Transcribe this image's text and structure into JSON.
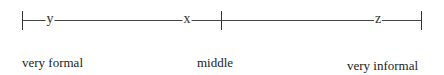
{
  "scale": {
    "marks": [
      {
        "letter": "y",
        "position": "near very formal"
      },
      {
        "letter": "x",
        "position": "near middle, formal side"
      },
      {
        "letter": "z",
        "position": "near very informal"
      }
    ],
    "labels": {
      "left": "very formal",
      "center": "middle",
      "right": "very informal"
    }
  },
  "colors": {
    "line": "#444444",
    "text": "#222222",
    "background": "#ffffff"
  }
}
